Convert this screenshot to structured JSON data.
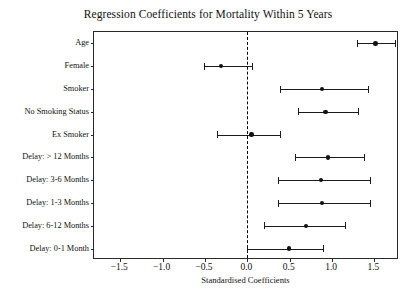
{
  "chart_data": {
    "type": "scatter",
    "title": "Regression Coefficients for Mortality Within 5 Years",
    "xlabel": "Standardised Coefficients",
    "ylabel": "",
    "xlim": [
      -1.81,
      1.79
    ],
    "xticks": [
      -1.5,
      -1.0,
      -0.5,
      0.0,
      0.5,
      1.0,
      1.5
    ],
    "xticklabels": [
      "−1.5",
      "−1.0",
      "−0.5",
      "0.0",
      "0.5",
      "1.0",
      "1.5"
    ],
    "grid": false,
    "legend": null,
    "reference_line": {
      "value": 0.0,
      "style": "dashed",
      "color": "#000000"
    },
    "categories": [
      "Age",
      "Female",
      "Smoker",
      "No Smoking Status",
      "Ex Smoker",
      "Delay: > 12 Months",
      "Delay: 3-6 Months",
      "Delay: 1-3 Months",
      "Delay: 6-12 Months",
      "Delay: 0-1 Month"
    ],
    "values": [
      1.51,
      -0.31,
      0.88,
      0.92,
      0.05,
      0.95,
      0.87,
      0.88,
      0.69,
      0.49
    ],
    "ci_low": [
      1.29,
      -0.51,
      0.39,
      0.6,
      -0.36,
      0.56,
      0.36,
      0.36,
      0.2,
      0.0
    ],
    "ci_high": [
      1.74,
      0.06,
      1.42,
      1.31,
      0.38,
      1.38,
      1.45,
      1.45,
      1.15,
      0.89
    ],
    "point_color": "#111111",
    "line_color": "#1b1b1b"
  }
}
